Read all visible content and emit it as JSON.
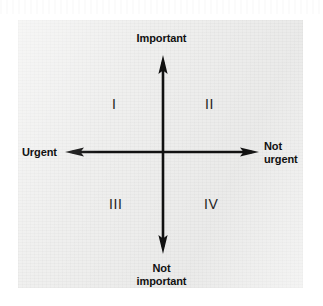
{
  "figure": {
    "type": "diagram",
    "name": "time-management-matrix",
    "background_color": "#ffffff",
    "panel_color": "#efefee",
    "axis_color": "#111111",
    "axes": {
      "vertical": {
        "top_label": "Important",
        "bottom_label_line1": "Not",
        "bottom_label_line2": "important",
        "bottom_label": "Not important",
        "arrow_heads": "both",
        "center_x": 163,
        "top_y": 56,
        "bottom_y": 253
      },
      "horizontal": {
        "left_label": "Urgent",
        "right_label_line1": "Not",
        "right_label_line2": "urgent",
        "right_label": "Not urgent",
        "arrow_heads": "both",
        "center_y": 152,
        "left_x": 66,
        "right_x": 258
      }
    },
    "quadrants": [
      {
        "id": "i",
        "numeral": "I",
        "position": "top-left",
        "urgency": "Urgent",
        "importance": "Important"
      },
      {
        "id": "ii",
        "numeral": "II",
        "position": "top-right",
        "urgency": "Not urgent",
        "importance": "Important"
      },
      {
        "id": "iii",
        "numeral": "III",
        "position": "bottom-left",
        "urgency": "Urgent",
        "importance": "Not important"
      },
      {
        "id": "iv",
        "numeral": "IV",
        "position": "bottom-right",
        "urgency": "Not urgent",
        "importance": "Not important"
      }
    ]
  }
}
